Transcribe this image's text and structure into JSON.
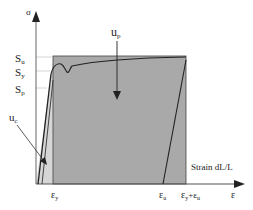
{
  "diagram": {
    "type": "stress-strain",
    "colors": {
      "plastic_area": "#a9a9a9",
      "elastic_area": "#d6d6d6",
      "curve": "#222222",
      "axis": "#555555",
      "guide": "#bbbbbb"
    },
    "y_axis": {
      "label": "σ"
    },
    "x_axis": {
      "label": "ε",
      "caption": "Strain  dL/L"
    },
    "y_ticks": [
      {
        "id": "su",
        "label": "S",
        "sub": "u"
      },
      {
        "id": "sy",
        "label": "S",
        "sub": "y"
      },
      {
        "id": "sp",
        "label": "S",
        "sub": "p"
      }
    ],
    "x_ticks": [
      {
        "id": "ey",
        "label": "ε",
        "sub": "y"
      },
      {
        "id": "eu",
        "label": "ε",
        "sub": "u"
      },
      {
        "id": "eyeu",
        "label": "ε",
        "sub": "y",
        "plus": "+ε",
        "sub2": "u"
      }
    ],
    "annotations": {
      "plastic_energy": {
        "label": "u",
        "sub": "p"
      },
      "elastic_energy": {
        "label": "u",
        "sub": "c"
      }
    }
  }
}
